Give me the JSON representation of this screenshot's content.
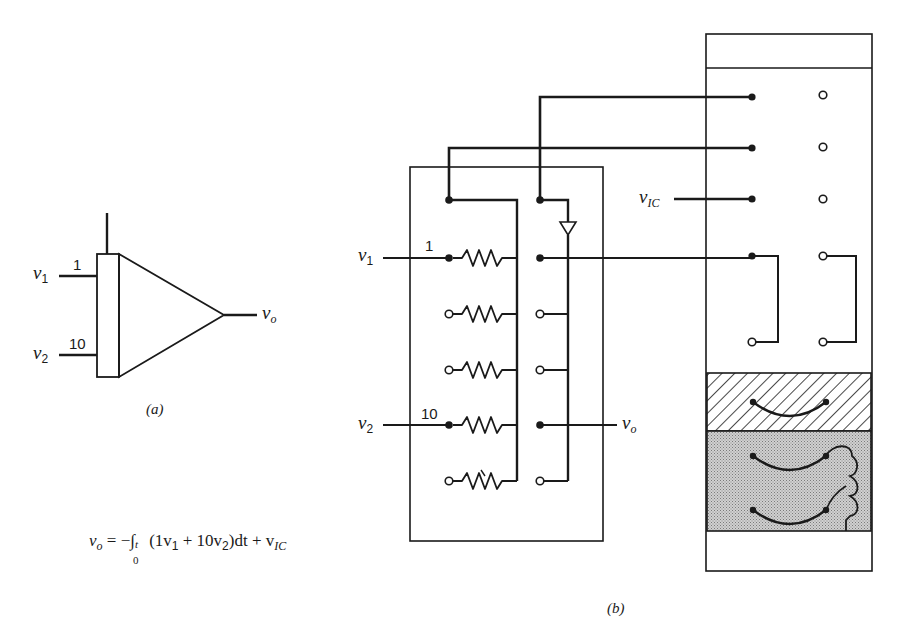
{
  "figure": {
    "panel_a": {
      "caption": "(a)",
      "inputs": [
        {
          "symbol": "v",
          "subscript": "1",
          "gain": "1"
        },
        {
          "symbol": "v",
          "subscript": "2",
          "gain": "10"
        }
      ],
      "output": {
        "symbol": "v",
        "subscript": "o"
      },
      "component": "integrator-amplifier"
    },
    "equation": {
      "lhs_symbol": "v",
      "lhs_subscript": "o",
      "rhs_prefix": " = −∫",
      "lower_limit": "0",
      "upper_limit": "t",
      "integrand": " (1v",
      "integrand_sub1": "1",
      "integrand_mid": " + 10v",
      "integrand_sub2": "2",
      "integrand_end": ")dt + v",
      "ic_subscript": "IC"
    },
    "panel_b": {
      "caption": "(b)",
      "inputs": [
        {
          "symbol": "v",
          "subscript": "1",
          "gain": "1"
        },
        {
          "symbol": "v",
          "subscript": "2",
          "gain": "10"
        }
      ],
      "output": {
        "symbol": "v",
        "subscript": "o"
      },
      "initial_condition": {
        "symbol": "v",
        "subscript": "IC"
      },
      "resistor_rows": 5,
      "patch_panel_rows": 5
    }
  }
}
